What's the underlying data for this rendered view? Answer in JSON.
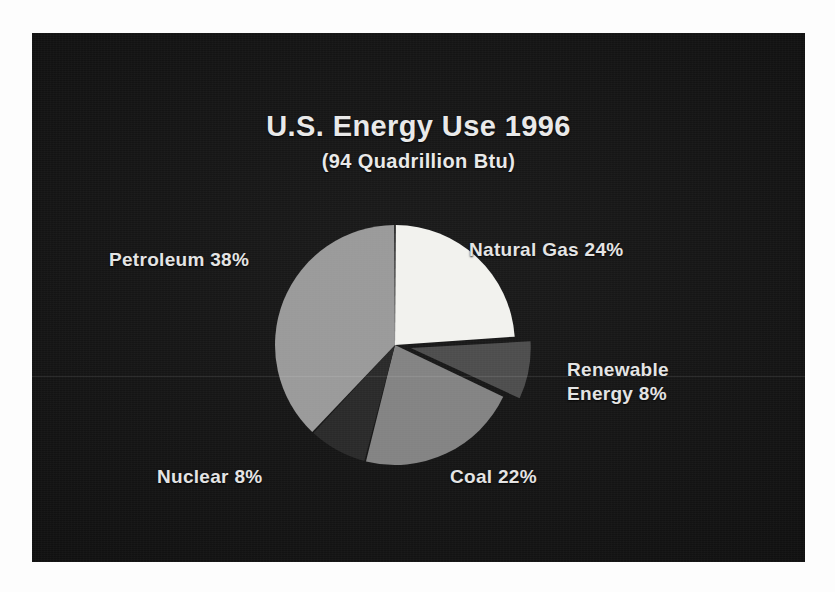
{
  "figure": {
    "title": "U.S. Energy Use 1996",
    "subtitle": "(94 Quadrillion Btu)"
  },
  "labels": {
    "natural_gas": "Natural Gas 24%",
    "petroleum": "Petroleum 38%",
    "renewable_line1": "Renewable",
    "renewable_line2": "Energy 8%",
    "nuclear": "Nuclear 8%",
    "coal": "Coal 22%"
  },
  "colors": {
    "panel_background": "#121212",
    "title_text": "#e9e9e9",
    "label_text": "#e4e4e4",
    "natural_gas": "#f2f2ee",
    "petroleum": "#9a9a9a",
    "renewable": "#4d4d4d",
    "coal": "#838383",
    "nuclear": "#2a2a2a"
  },
  "chart_data": {
    "type": "pie",
    "title": "U.S. Energy Use 1996",
    "subtitle": "(94 Quadrillion Btu)",
    "total_label": "94 Quadrillion Btu",
    "total_value": 94,
    "unit": "Quadrillion Btu",
    "year": 1996,
    "start_angle_deg": 0,
    "direction": "clockwise",
    "exploded_slices": [
      "Renewable Energy"
    ],
    "legend": "none (direct slice labels)",
    "categories": [
      "Natural Gas",
      "Renewable Energy",
      "Coal",
      "Nuclear",
      "Petroleum"
    ],
    "values": [
      24,
      8,
      22,
      8,
      38
    ],
    "slices": [
      {
        "name": "Natural Gas",
        "value": 24,
        "label": "Natural Gas 24%",
        "color": "#f2f2ee",
        "exploded": false
      },
      {
        "name": "Renewable Energy",
        "value": 8,
        "label": "Renewable Energy 8%",
        "color": "#4d4d4d",
        "exploded": true
      },
      {
        "name": "Coal",
        "value": 22,
        "label": "Coal 22%",
        "color": "#838383",
        "exploded": false
      },
      {
        "name": "Nuclear",
        "value": 8,
        "label": "Nuclear 8%",
        "color": "#2a2a2a",
        "exploded": false
      },
      {
        "name": "Petroleum",
        "value": 38,
        "label": "Petroleum 38%",
        "color": "#9a9a9a",
        "exploded": false
      }
    ]
  }
}
